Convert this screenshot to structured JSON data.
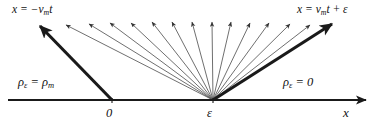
{
  "figure": {
    "type": "characteristics-diagram",
    "background_color": "#ffffff",
    "line_color": "#1a1a1a",
    "thin_line_color": "#555555"
  },
  "labels": {
    "left_boundary": {
      "lhs": "x",
      "eq": "=",
      "rhs_sign": "−",
      "rhs_var": "v",
      "rhs_sub": "m",
      "rhs_t": "t"
    },
    "right_boundary": {
      "lhs": "x",
      "eq": "=",
      "rhs_var": "v",
      "rhs_sub": "m",
      "rhs_t": "t",
      "plus": "+",
      "eps": "ε"
    },
    "density_left": {
      "rho": "ρ",
      "sub": "ε",
      "eq": "=",
      "rho2": "ρ",
      "sub2": "m"
    },
    "density_right": {
      "rho": "ρ",
      "sub": "ε",
      "eq": "=",
      "value": "0"
    },
    "tick_zero": "0",
    "tick_epsilon": "ε",
    "axis_x": "x"
  },
  "chart_data": {
    "type": "line",
    "title": "",
    "xlabel": "x",
    "ylabel": "",
    "axis": {
      "y": 100,
      "x_start": 8,
      "x_end": 366,
      "arrow": "right"
    },
    "origin_points": {
      "zero_x": 112,
      "epsilon_x": 213
    },
    "bold_rays": [
      {
        "name": "left-boundary-ray",
        "from_x": 112,
        "from_y": 100,
        "to_x": 40,
        "to_y": 26,
        "width": 3.1
      },
      {
        "name": "right-boundary-ray",
        "from_x": 213,
        "from_y": 100,
        "to_x": 332,
        "to_y": 24,
        "width": 3.1
      }
    ],
    "fan_rays_count": 13,
    "fan_rays": [
      {
        "to_x": 66,
        "to_y": 25
      },
      {
        "to_x": 89,
        "to_y": 24
      },
      {
        "to_x": 110,
        "to_y": 23
      },
      {
        "to_x": 131,
        "to_y": 23
      },
      {
        "to_x": 152,
        "to_y": 22
      },
      {
        "to_x": 172,
        "to_y": 22
      },
      {
        "to_x": 192,
        "to_y": 22
      },
      {
        "to_x": 212,
        "to_y": 22
      },
      {
        "to_x": 231,
        "to_y": 22
      },
      {
        "to_x": 250,
        "to_y": 23
      },
      {
        "to_x": 269,
        "to_y": 23
      },
      {
        "to_x": 290,
        "to_y": 24
      },
      {
        "to_x": 310,
        "to_y": 25
      }
    ]
  }
}
